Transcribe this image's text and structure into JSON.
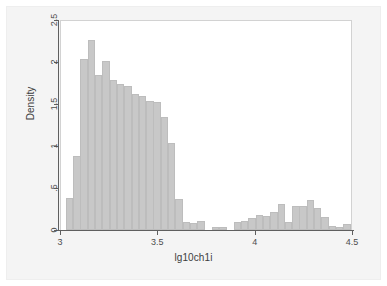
{
  "chart_data": {
    "type": "bar",
    "title": "",
    "subtitle": "",
    "xlabel": "lg10ch1i",
    "ylabel": "Density",
    "xlim": [
      3.0,
      4.5
    ],
    "ylim": [
      0,
      2.5
    ],
    "grid": false,
    "legend": null,
    "legend_position": "none",
    "bar_color": "#c8c8c8",
    "bar_edge_color": "#bdbdbd",
    "plot_background": "#ffffff",
    "figure_background": "#f4f4f4",
    "axis_color": "#5f5f5f",
    "bin_width": 0.0375,
    "xticks": [
      "3",
      "3.5",
      "4",
      "4.5"
    ],
    "xtick_values": [
      3,
      3.5,
      4,
      4.5
    ],
    "yticks": [
      "0",
      ".5",
      "1",
      "1.5",
      "2",
      "2.5"
    ],
    "ytick_values": [
      0,
      0.5,
      1,
      1.5,
      2,
      2.5
    ],
    "bins": [
      {
        "x0": 3.03,
        "value": 0.38
      },
      {
        "x0": 3.068,
        "value": 0.88
      },
      {
        "x0": 3.105,
        "value": 2.03
      },
      {
        "x0": 3.143,
        "value": 2.26
      },
      {
        "x0": 3.18,
        "value": 1.84
      },
      {
        "x0": 3.218,
        "value": 2.01
      },
      {
        "x0": 3.255,
        "value": 1.78
      },
      {
        "x0": 3.293,
        "value": 1.74
      },
      {
        "x0": 3.33,
        "value": 1.72
      },
      {
        "x0": 3.368,
        "value": 1.62
      },
      {
        "x0": 3.405,
        "value": 1.6
      },
      {
        "x0": 3.443,
        "value": 1.54
      },
      {
        "x0": 3.48,
        "value": 1.52
      },
      {
        "x0": 3.518,
        "value": 1.35
      },
      {
        "x0": 3.555,
        "value": 1.03
      },
      {
        "x0": 3.593,
        "value": 0.37
      },
      {
        "x0": 3.63,
        "value": 0.09
      },
      {
        "x0": 3.668,
        "value": 0.08
      },
      {
        "x0": 3.705,
        "value": 0.11
      },
      {
        "x0": 3.743,
        "value": 0.0
      },
      {
        "x0": 3.78,
        "value": 0.04
      },
      {
        "x0": 3.818,
        "value": 0.03
      },
      {
        "x0": 3.855,
        "value": 0.0
      },
      {
        "x0": 3.893,
        "value": 0.1
      },
      {
        "x0": 3.93,
        "value": 0.11
      },
      {
        "x0": 3.968,
        "value": 0.14
      },
      {
        "x0": 4.005,
        "value": 0.18
      },
      {
        "x0": 4.043,
        "value": 0.17
      },
      {
        "x0": 4.08,
        "value": 0.22
      },
      {
        "x0": 4.118,
        "value": 0.31
      },
      {
        "x0": 4.155,
        "value": 0.1
      },
      {
        "x0": 4.193,
        "value": 0.28
      },
      {
        "x0": 4.23,
        "value": 0.29
      },
      {
        "x0": 4.268,
        "value": 0.36
      },
      {
        "x0": 4.305,
        "value": 0.26
      },
      {
        "x0": 4.343,
        "value": 0.16
      },
      {
        "x0": 4.38,
        "value": 0.05
      },
      {
        "x0": 4.418,
        "value": 0.04
      },
      {
        "x0": 4.455,
        "value": 0.07
      }
    ]
  }
}
